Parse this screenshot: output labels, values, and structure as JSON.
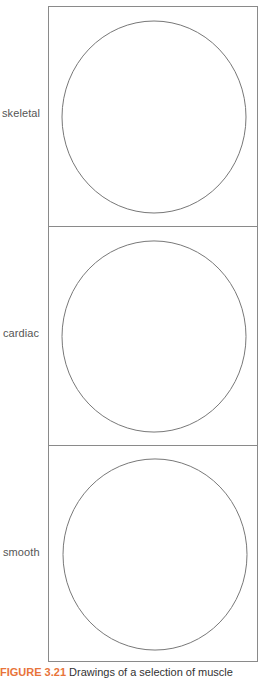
{
  "figure": {
    "panels": [
      {
        "label": "skeletal",
        "shape": "circle",
        "stroke": "#777777"
      },
      {
        "label": "cardiac",
        "shape": "circle",
        "stroke": "#777777"
      },
      {
        "label": "smooth",
        "shape": "circle",
        "stroke": "#777777"
      }
    ],
    "frame_color": "#8a8a8a"
  },
  "caption": {
    "figure_label": "FIGURE 3.21",
    "text": "Drawings of a selection of muscle",
    "label_color": "#e8743a"
  }
}
